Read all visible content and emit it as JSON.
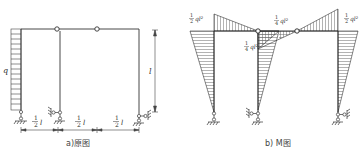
{
  "figure_a": {
    "caption": "a)原图",
    "load_label": "q",
    "height_label": "l",
    "spans": [
      {
        "num": "1",
        "den": "2",
        "var": "l"
      },
      {
        "num": "1",
        "den": "2",
        "var": "l"
      },
      {
        "num": "1",
        "den": "2",
        "var": "l"
      }
    ]
  },
  "figure_b": {
    "caption": "b) M图",
    "labels": {
      "left_top": {
        "num": "1",
        "den": "2",
        "expr": "ql²"
      },
      "middle_top": {
        "num": "1",
        "den": "4",
        "expr": "ql²"
      },
      "middle_mid": {
        "num": "1",
        "den": "4",
        "expr": "ql²"
      },
      "right_top": {
        "num": "1",
        "den": "2",
        "expr": "ql²"
      }
    }
  },
  "colors": {
    "line": "#333333",
    "hatch": "#555555",
    "background": "#ffffff"
  }
}
